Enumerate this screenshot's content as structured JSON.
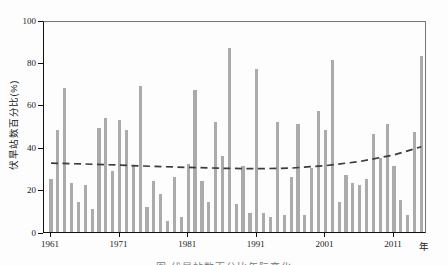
{
  "chart_data": {
    "type": "bar",
    "title": "",
    "ylabel": "伏旱站数百分比(%)",
    "xlabel": "年",
    "ylim": [
      0,
      100
    ],
    "ytick_values": [
      0,
      20,
      40,
      60,
      80,
      100
    ],
    "ytick_labels": [
      "0",
      "20",
      "40",
      "60",
      "80",
      "100"
    ],
    "xtick_years": [
      1961,
      1971,
      1981,
      1991,
      2001,
      2011
    ],
    "xtick_labels": [
      "1961",
      "1971",
      "1981",
      "1991",
      "2001",
      "2011"
    ],
    "grid": false,
    "legend": "none",
    "bar_color": "#ababab",
    "trend_color": "#3c3c3c",
    "years": [
      1961,
      1962,
      1963,
      1964,
      1965,
      1966,
      1967,
      1968,
      1969,
      1970,
      1971,
      1972,
      1973,
      1974,
      1975,
      1976,
      1977,
      1978,
      1979,
      1980,
      1981,
      1982,
      1983,
      1984,
      1985,
      1986,
      1987,
      1988,
      1989,
      1990,
      1991,
      1992,
      1993,
      1994,
      1995,
      1996,
      1997,
      1998,
      1999,
      2000,
      2001,
      2002,
      2003,
      2004,
      2005,
      2006,
      2007,
      2008,
      2009,
      2010,
      2011,
      2012,
      2013,
      2014,
      2015
    ],
    "values": [
      25,
      48,
      68,
      23,
      14,
      22,
      11,
      49,
      54,
      29,
      53,
      48,
      31,
      69,
      12,
      24,
      18,
      5,
      26,
      7,
      32,
      67,
      24,
      14,
      52,
      36,
      87,
      13,
      31,
      9,
      77,
      9,
      7,
      52,
      8,
      26,
      51,
      8,
      30,
      57,
      48,
      81,
      14,
      27,
      23,
      22,
      25,
      46,
      35,
      51,
      31,
      15,
      8,
      47,
      83
    ],
    "trend": {
      "style": "dashed",
      "points": [
        [
          1961,
          33.4
        ],
        [
          1966,
          33.0
        ],
        [
          1971,
          32.5
        ],
        [
          1976,
          31.9
        ],
        [
          1981,
          31.4
        ],
        [
          1986,
          31.0
        ],
        [
          1991,
          30.8
        ],
        [
          1996,
          31.1
        ],
        [
          2001,
          32.2
        ],
        [
          2006,
          34.2
        ],
        [
          2011,
          37.3
        ],
        [
          2015,
          41.2
        ]
      ]
    }
  },
  "caption": {
    "text": "图  伏旱站数百分比年际变化"
  }
}
